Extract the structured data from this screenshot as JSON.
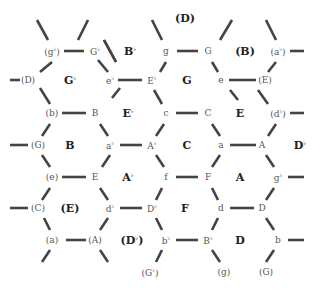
{
  "line_color": "#444444",
  "nodes": [
    {
      "id": "n1",
      "text": "(g♭)",
      "x": 52,
      "y": 51
    },
    {
      "id": "n2",
      "text": "G♭",
      "x": 95,
      "y": 51
    },
    {
      "id": "n3",
      "text": "g",
      "x": 166,
      "y": 51
    },
    {
      "id": "n4",
      "text": "G",
      "x": 208,
      "y": 51
    },
    {
      "id": "n5",
      "text": "(a♭)",
      "x": 278,
      "y": 51
    },
    {
      "id": "n6",
      "text": "(D)",
      "x": 28,
      "y": 80
    },
    {
      "id": "n7",
      "text": "e♭",
      "x": 110,
      "y": 80
    },
    {
      "id": "n8",
      "text": "E♭",
      "x": 152,
      "y": 80
    },
    {
      "id": "n9",
      "text": "e",
      "x": 221,
      "y": 80
    },
    {
      "id": "n10",
      "text": "(E)",
      "x": 265,
      "y": 80
    },
    {
      "id": "n11",
      "text": "(b)",
      "x": 52,
      "y": 113
    },
    {
      "id": "n12",
      "text": "B",
      "x": 95,
      "y": 113
    },
    {
      "id": "n13",
      "text": "c",
      "x": 166,
      "y": 113
    },
    {
      "id": "n14",
      "text": "C",
      "x": 208,
      "y": 113
    },
    {
      "id": "n15",
      "text": "(d♭)",
      "x": 278,
      "y": 113
    },
    {
      "id": "n16",
      "text": "(G)",
      "x": 38,
      "y": 145
    },
    {
      "id": "n17",
      "text": "a♭",
      "x": 110,
      "y": 145
    },
    {
      "id": "n18",
      "text": "A♭",
      "x": 152,
      "y": 145
    },
    {
      "id": "n19",
      "text": "a",
      "x": 221,
      "y": 145
    },
    {
      "id": "n20",
      "text": "A",
      "x": 262,
      "y": 145
    },
    {
      "id": "n21",
      "text": "(e)",
      "x": 52,
      "y": 177
    },
    {
      "id": "n22",
      "text": "E",
      "x": 95,
      "y": 177
    },
    {
      "id": "n23",
      "text": "f",
      "x": 166,
      "y": 177
    },
    {
      "id": "n24",
      "text": "F",
      "x": 208,
      "y": 177
    },
    {
      "id": "n25",
      "text": "g♭",
      "x": 278,
      "y": 177
    },
    {
      "id": "n26",
      "text": "(C)",
      "x": 38,
      "y": 208
    },
    {
      "id": "n27",
      "text": "d♭",
      "x": 110,
      "y": 208
    },
    {
      "id": "n28",
      "text": "D♭",
      "x": 152,
      "y": 208
    },
    {
      "id": "n29",
      "text": "d",
      "x": 221,
      "y": 208
    },
    {
      "id": "n30",
      "text": "D",
      "x": 262,
      "y": 208
    },
    {
      "id": "n31",
      "text": "(a)",
      "x": 52,
      "y": 240
    },
    {
      "id": "n32",
      "text": "(A)",
      "x": 95,
      "y": 240
    },
    {
      "id": "n33",
      "text": "b♭",
      "x": 166,
      "y": 240
    },
    {
      "id": "n34",
      "text": "B♭",
      "x": 208,
      "y": 240
    },
    {
      "id": "n35",
      "text": "b",
      "x": 278,
      "y": 240
    },
    {
      "id": "n36",
      "text": "(G♭)",
      "x": 150,
      "y": 272
    },
    {
      "id": "n37",
      "text": "(g)",
      "x": 224,
      "y": 272
    },
    {
      "id": "n38",
      "text": "(G)",
      "x": 266,
      "y": 272
    }
  ],
  "chords": [
    {
      "text": "(D)",
      "x": 185,
      "y": 18
    },
    {
      "text": "B♭",
      "x": 130,
      "y": 51
    },
    {
      "text": "(B)",
      "x": 245,
      "y": 51
    },
    {
      "text": "G♭",
      "x": 70,
      "y": 80
    },
    {
      "text": "G",
      "x": 187,
      "y": 80
    },
    {
      "text": "E♭",
      "x": 128,
      "y": 113
    },
    {
      "text": "E",
      "x": 240,
      "y": 113
    },
    {
      "text": "B",
      "x": 70,
      "y": 145
    },
    {
      "text": "C",
      "x": 187,
      "y": 145
    },
    {
      "text": "D♭",
      "x": 300,
      "y": 145
    },
    {
      "text": "A♭",
      "x": 128,
      "y": 177
    },
    {
      "text": "A",
      "x": 240,
      "y": 177
    },
    {
      "text": "(E)",
      "x": 70,
      "y": 208
    },
    {
      "text": "F",
      "x": 185,
      "y": 208
    },
    {
      "text": "(D♭)",
      "x": 132,
      "y": 240
    },
    {
      "text": "D",
      "x": 240,
      "y": 240
    }
  ],
  "edges": [
    [
      37,
      20,
      48,
      40
    ],
    [
      78,
      40,
      88,
      20
    ],
    [
      104,
      40,
      116,
      62
    ],
    [
      116,
      62,
      104,
      40
    ],
    [
      64,
      51,
      84,
      51
    ],
    [
      177,
      51,
      198,
      51
    ],
    [
      220,
      40,
      232,
      20
    ],
    [
      152,
      20,
      162,
      40
    ],
    [
      266,
      20,
      276,
      40
    ],
    [
      290,
      51,
      304,
      51
    ],
    [
      52,
      62,
      40,
      72
    ],
    [
      10,
      80,
      20,
      80
    ],
    [
      98,
      60,
      108,
      72
    ],
    [
      118,
      80,
      142,
      80
    ],
    [
      160,
      72,
      166,
      62
    ],
    [
      212,
      62,
      218,
      72
    ],
    [
      229,
      80,
      256,
      80
    ],
    [
      276,
      62,
      268,
      72
    ],
    [
      40,
      88,
      50,
      104
    ],
    [
      120,
      88,
      112,
      98
    ],
    [
      154,
      90,
      162,
      104
    ],
    [
      230,
      90,
      238,
      100
    ],
    [
      258,
      90,
      268,
      104
    ],
    [
      62,
      113,
      86,
      113
    ],
    [
      176,
      113,
      198,
      113
    ],
    [
      290,
      113,
      304,
      113
    ],
    [
      50,
      124,
      42,
      136
    ],
    [
      100,
      124,
      108,
      136
    ],
    [
      164,
      124,
      156,
      136
    ],
    [
      212,
      124,
      220,
      136
    ],
    [
      276,
      124,
      268,
      136
    ],
    [
      10,
      145,
      28,
      145
    ],
    [
      120,
      145,
      142,
      145
    ],
    [
      230,
      145,
      256,
      145
    ],
    [
      42,
      155,
      50,
      167
    ],
    [
      110,
      155,
      102,
      167
    ],
    [
      156,
      155,
      164,
      167
    ],
    [
      220,
      155,
      212,
      167
    ],
    [
      266,
      155,
      274,
      167
    ],
    [
      62,
      177,
      86,
      177
    ],
    [
      176,
      177,
      198,
      177
    ],
    [
      288,
      177,
      304,
      177
    ],
    [
      50,
      188,
      42,
      200
    ],
    [
      100,
      188,
      108,
      200
    ],
    [
      162,
      188,
      156,
      200
    ],
    [
      212,
      188,
      218,
      200
    ],
    [
      274,
      188,
      266,
      200
    ],
    [
      10,
      208,
      28,
      208
    ],
    [
      120,
      208,
      142,
      208
    ],
    [
      230,
      208,
      254,
      208
    ],
    [
      44,
      218,
      50,
      230
    ],
    [
      108,
      218,
      100,
      230
    ],
    [
      156,
      218,
      162,
      230
    ],
    [
      218,
      218,
      212,
      230
    ],
    [
      266,
      218,
      274,
      230
    ],
    [
      66,
      240,
      86,
      240
    ],
    [
      176,
      240,
      198,
      240
    ],
    [
      288,
      240,
      304,
      240
    ],
    [
      50,
      250,
      42,
      262
    ],
    [
      100,
      250,
      108,
      262
    ],
    [
      162,
      250,
      156,
      262
    ],
    [
      212,
      250,
      220,
      262
    ],
    [
      274,
      250,
      266,
      262
    ]
  ]
}
